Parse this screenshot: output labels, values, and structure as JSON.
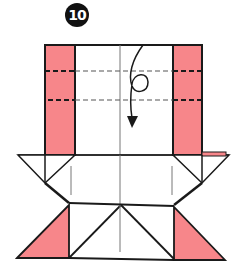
{
  "diagram": {
    "step_number": "10",
    "description": "Origami folding step: valley-fold along dashed lines and turn over, shown by looping arrow",
    "colors": {
      "paper_color_side": "#f7868a",
      "paper_white_side": "#ffffff",
      "line_color": "#1a1a1a",
      "crease_color": "#777777"
    },
    "symbols": {
      "fold_lines": [
        "valley-fold-line-upper",
        "valley-fold-line-lower"
      ],
      "arrow": "fold-and-turn-arrow"
    }
  }
}
